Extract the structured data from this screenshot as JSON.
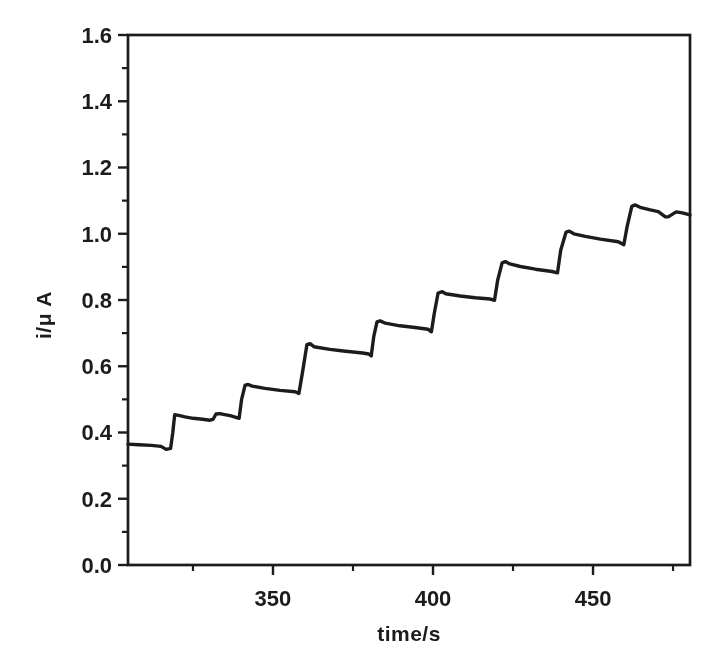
{
  "figure": {
    "background": "#ffffff",
    "ink_color": "#1c1c1c"
  },
  "chart_data": {
    "type": "line",
    "title": "",
    "xlabel": "time/s",
    "ylabel": "i/μ A",
    "xlim": [
      304.7,
      480.3
    ],
    "ylim": [
      0.0,
      1.6
    ],
    "x_major_ticks": [
      350,
      400,
      450
    ],
    "x_minor_ticks": [
      325,
      375,
      425,
      475
    ],
    "y_major_ticks": [
      0.0,
      0.2,
      0.4,
      0.6,
      0.8,
      1.0,
      1.2,
      1.4,
      1.6
    ],
    "y_minor_ticks": [
      0.1,
      0.3,
      0.5,
      0.7,
      0.9,
      1.1,
      1.3,
      1.5
    ],
    "grid": false,
    "legend": false,
    "frame": "full-box",
    "tick_direction": "out",
    "series": [
      {
        "name": "current-trace",
        "color": "#1c1c1c",
        "points": [
          [
            304.7,
            0.365
          ],
          [
            308.0,
            0.363
          ],
          [
            312.0,
            0.361
          ],
          [
            315.0,
            0.358
          ],
          [
            316.6,
            0.349
          ],
          [
            318.0,
            0.352
          ],
          [
            318.7,
            0.4
          ],
          [
            319.3,
            0.454
          ],
          [
            320.5,
            0.452
          ],
          [
            322.5,
            0.447
          ],
          [
            325.0,
            0.443
          ],
          [
            328.0,
            0.44
          ],
          [
            330.3,
            0.437
          ],
          [
            331.3,
            0.44
          ],
          [
            332.2,
            0.456
          ],
          [
            333.5,
            0.457
          ],
          [
            334.5,
            0.455
          ],
          [
            336.6,
            0.451
          ],
          [
            338.4,
            0.446
          ],
          [
            339.4,
            0.443
          ],
          [
            340.2,
            0.5
          ],
          [
            341.3,
            0.543
          ],
          [
            342.3,
            0.545
          ],
          [
            343.5,
            0.54
          ],
          [
            347.5,
            0.533
          ],
          [
            352.2,
            0.527
          ],
          [
            356.9,
            0.523
          ],
          [
            358.1,
            0.518
          ],
          [
            359.2,
            0.58
          ],
          [
            360.6,
            0.665
          ],
          [
            361.6,
            0.668
          ],
          [
            362.8,
            0.659
          ],
          [
            367.8,
            0.651
          ],
          [
            372.0,
            0.646
          ],
          [
            378.0,
            0.64
          ],
          [
            379.9,
            0.637
          ],
          [
            380.7,
            0.631
          ],
          [
            381.5,
            0.69
          ],
          [
            382.5,
            0.734
          ],
          [
            383.5,
            0.737
          ],
          [
            385.1,
            0.73
          ],
          [
            389.7,
            0.722
          ],
          [
            394.4,
            0.717
          ],
          [
            398.4,
            0.712
          ],
          [
            399.5,
            0.704
          ],
          [
            400.4,
            0.76
          ],
          [
            401.6,
            0.821
          ],
          [
            402.9,
            0.825
          ],
          [
            404.0,
            0.819
          ],
          [
            408.5,
            0.812
          ],
          [
            413.2,
            0.807
          ],
          [
            417.8,
            0.803
          ],
          [
            419.2,
            0.799
          ],
          [
            420.2,
            0.86
          ],
          [
            421.6,
            0.912
          ],
          [
            422.6,
            0.916
          ],
          [
            424.0,
            0.909
          ],
          [
            427.3,
            0.901
          ],
          [
            432.0,
            0.893
          ],
          [
            437.2,
            0.886
          ],
          [
            438.9,
            0.882
          ],
          [
            439.9,
            0.95
          ],
          [
            441.6,
            1.005
          ],
          [
            442.6,
            1.008
          ],
          [
            444.0,
            1.0
          ],
          [
            447.6,
            0.992
          ],
          [
            452.3,
            0.984
          ],
          [
            457.9,
            0.976
          ],
          [
            459.6,
            0.967
          ],
          [
            460.6,
            1.02
          ],
          [
            462.1,
            1.083
          ],
          [
            463.2,
            1.087
          ],
          [
            464.7,
            1.08
          ],
          [
            467.9,
            1.072
          ],
          [
            470.4,
            1.067
          ],
          [
            472.6,
            1.051
          ],
          [
            473.5,
            1.051
          ],
          [
            476.0,
            1.066
          ],
          [
            477.9,
            1.063
          ],
          [
            480.3,
            1.057
          ]
        ]
      }
    ]
  }
}
